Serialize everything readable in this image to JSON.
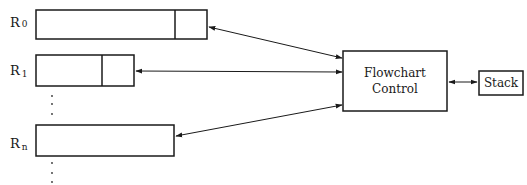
{
  "diagram": {
    "registers": [
      {
        "label": "R",
        "subscript": "0"
      },
      {
        "label": "R",
        "subscript": "1"
      },
      {
        "label": "R",
        "subscript": "n"
      }
    ],
    "ellipsis": "⋮",
    "controller": {
      "line1": "Flowchart",
      "line2": "Control"
    },
    "stack": {
      "label": "Stack"
    },
    "edges": [
      {
        "from": "R0",
        "to": "Flowchart Control",
        "direction": "bidirectional"
      },
      {
        "from": "R1",
        "to": "Flowchart Control",
        "direction": "bidirectional"
      },
      {
        "from": "Rn",
        "to": "Flowchart Control",
        "direction": "bidirectional"
      },
      {
        "from": "Flowchart Control",
        "to": "Stack",
        "direction": "bidirectional"
      }
    ]
  }
}
